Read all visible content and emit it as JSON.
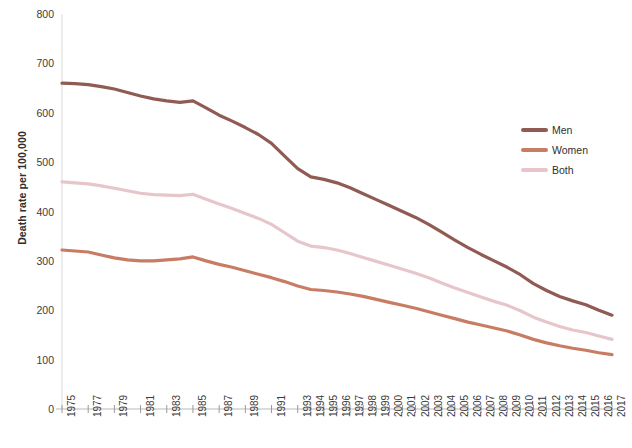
{
  "chart_data": {
    "type": "line",
    "title": "",
    "xlabel": "",
    "ylabel": "Death rate per 100,000",
    "ylim": [
      0,
      800
    ],
    "yticks": [
      0,
      100,
      200,
      300,
      400,
      500,
      600,
      700,
      800
    ],
    "grid": false,
    "legend_position": "right",
    "categories": [
      "1975",
      "1976",
      "1977",
      "1978",
      "1979",
      "1980",
      "1981",
      "1982",
      "1983",
      "1984",
      "1985",
      "1986",
      "1987",
      "1988",
      "1989",
      "1990",
      "1991",
      "1992",
      "1993",
      "1994",
      "1995",
      "1996",
      "1997",
      "1998",
      "1999",
      "2000",
      "2001",
      "2002",
      "2003",
      "2004",
      "2005",
      "2006",
      "2007",
      "2008",
      "2009",
      "2010",
      "2011",
      "2012",
      "2013",
      "2014",
      "2015",
      "2016",
      "2017"
    ],
    "xtick_labels": [
      "1975",
      "1977",
      "1979",
      "1981",
      "1983",
      "1985",
      "1987",
      "1989",
      "1991",
      "1993",
      "1994",
      "1995",
      "1996",
      "1997",
      "1998",
      "1999",
      "2000",
      "2001",
      "2002",
      "2003",
      "2004",
      "2005",
      "2006",
      "2007",
      "2008",
      "2009",
      "2010",
      "2011",
      "2012",
      "2013",
      "2014",
      "2015",
      "2016",
      "2017"
    ],
    "series": [
      {
        "name": "Men",
        "color": "#8f5b52",
        "values": [
          660,
          659,
          657,
          653,
          648,
          641,
          634,
          628,
          624,
          621,
          624,
          610,
          595,
          583,
          570,
          556,
          538,
          512,
          487,
          470,
          465,
          458,
          448,
          436,
          424,
          412,
          400,
          388,
          374,
          358,
          342,
          327,
          313,
          300,
          287,
          272,
          254,
          240,
          228,
          219,
          211,
          200,
          190
        ]
      },
      {
        "name": "Women",
        "color": "#c87c64",
        "values": [
          322,
          320,
          318,
          312,
          306,
          302,
          300,
          300,
          302,
          304,
          308,
          300,
          293,
          287,
          280,
          273,
          266,
          258,
          249,
          242,
          240,
          237,
          233,
          228,
          222,
          216,
          210,
          204,
          197,
          190,
          183,
          176,
          170,
          164,
          158,
          150,
          141,
          134,
          128,
          123,
          119,
          114,
          110
        ]
      },
      {
        "name": "Both",
        "color": "#e7c6cb",
        "values": [
          460,
          458,
          456,
          452,
          447,
          442,
          437,
          434,
          433,
          432,
          435,
          425,
          415,
          406,
          396,
          386,
          374,
          357,
          340,
          330,
          327,
          322,
          315,
          307,
          299,
          291,
          283,
          275,
          266,
          255,
          245,
          236,
          227,
          218,
          210,
          199,
          186,
          176,
          167,
          160,
          155,
          148,
          141
        ]
      }
    ]
  },
  "legend": {
    "items": [
      {
        "label": "Men",
        "color": "#8f5b52"
      },
      {
        "label": "Women",
        "color": "#c87c64"
      },
      {
        "label": "Both",
        "color": "#e7c6cb"
      }
    ]
  },
  "axis": {
    "y_title": "Death rate per 100,000"
  }
}
